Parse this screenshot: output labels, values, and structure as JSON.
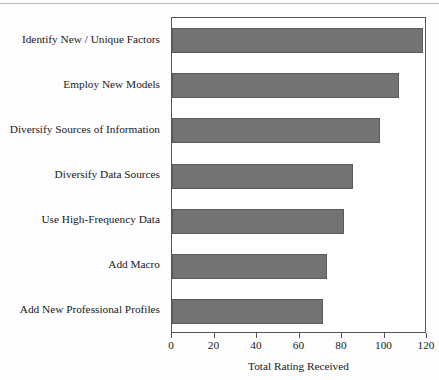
{
  "chart_data": {
    "type": "bar",
    "orientation": "horizontal",
    "title": "",
    "xlabel": "Total Rating Received",
    "ylabel": "",
    "xlim": [
      0,
      120
    ],
    "xticks": [
      0,
      20,
      40,
      60,
      80,
      100,
      120
    ],
    "grid": false,
    "legend": null,
    "bar_color": "#737373",
    "bar_edge_color": "#5a5a5a",
    "plot_background": "#ffffff",
    "frame_color": "#555555",
    "categories": [
      "Identify New / Unique Factors",
      "Employ New Models",
      "Diversify Sources of Information",
      "Diversify Data Sources",
      "Use High-Frequency Data",
      "Add Macro",
      "Add New Professional Profiles"
    ],
    "values": [
      118,
      107,
      98,
      85,
      81,
      73,
      71
    ]
  }
}
